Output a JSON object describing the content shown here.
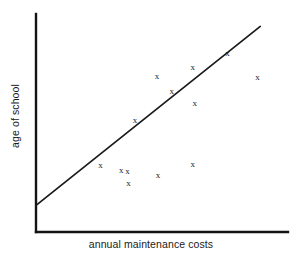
{
  "chart_data": {
    "type": "scatter",
    "title": "",
    "xlabel": "annual maintenance costs",
    "ylabel": "age of school",
    "grid": false,
    "legend": null,
    "axis_ticks": [],
    "marker_symbol": "x",
    "xlim": [
      0,
      100
    ],
    "ylim": [
      0,
      100
    ],
    "points": [
      {
        "x": 25.6,
        "y": 30.7
      },
      {
        "x": 36.3,
        "y": 27.8
      },
      {
        "x": 36.7,
        "y": 22.4
      },
      {
        "x": 39.3,
        "y": 51.2
      },
      {
        "x": 48.0,
        "y": 71.7
      },
      {
        "x": 48.4,
        "y": 26.0
      },
      {
        "x": 62.2,
        "y": 75.8
      },
      {
        "x": 62.2,
        "y": 31.0
      },
      {
        "x": 63.0,
        "y": 59.2
      },
      {
        "x": 76.0,
        "y": 82.1
      },
      {
        "x": 87.9,
        "y": 70.9
      },
      {
        "x": 33.8,
        "y": 28.5
      },
      {
        "x": 53.9,
        "y": 64.6
      }
    ],
    "trend_line": {
      "label": "line of best fit",
      "x_start": 0.0,
      "y_start": 12.2,
      "x_end": 89.0,
      "y_end": 94.3
    },
    "annotations": []
  },
  "axes": {
    "x_axis_name": "x-axis",
    "y_axis_name": "y-axis"
  },
  "colors": {
    "axis": "#141414",
    "line": "#1a1a1a",
    "marker": "#1f1f1f",
    "background": "#ffffff"
  }
}
